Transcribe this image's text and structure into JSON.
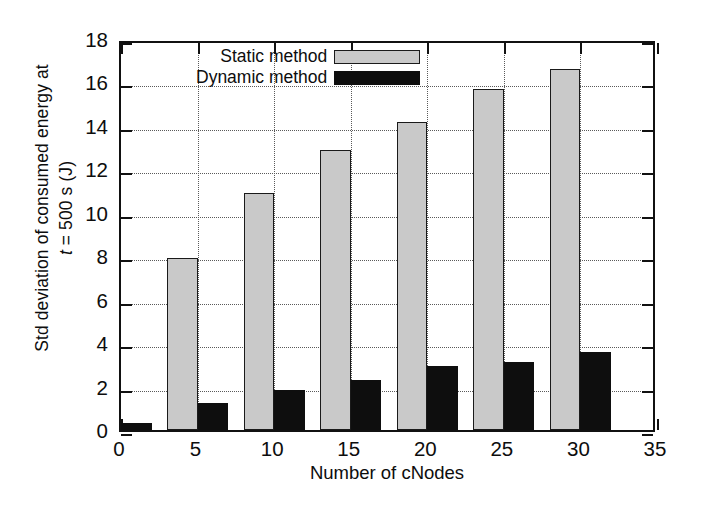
{
  "chart_data": {
    "type": "bar",
    "title": "",
    "xlabel": "Number of cNodes",
    "ylabel_line1": "Std deviation of consumed energy at",
    "ylabel_line2_prefix": "t",
    "ylabel_line2_rest": " = 500 s (J)",
    "categories": [
      0,
      5,
      10,
      15,
      20,
      25,
      30
    ],
    "xlim": [
      0,
      35
    ],
    "ylim": [
      0,
      18
    ],
    "xticks": [
      0,
      5,
      10,
      15,
      20,
      25,
      30,
      35
    ],
    "yticks": [
      0,
      2,
      4,
      6,
      8,
      10,
      12,
      14,
      16,
      18
    ],
    "grid": "dotted-both",
    "legend_position": "top-center",
    "series": [
      {
        "name": "Static method",
        "color": "#c9c9c9",
        "values": [
          null,
          7.9,
          10.9,
          12.9,
          14.2,
          15.7,
          16.6
        ]
      },
      {
        "name": "Dynamic method",
        "color": "#0e0e0e",
        "values": [
          0.3,
          1.25,
          1.85,
          2.3,
          2.95,
          3.15,
          3.6
        ]
      }
    ]
  },
  "legend": {
    "items": [
      {
        "label": "Static method",
        "swatch": "static"
      },
      {
        "label": "Dynamic method",
        "swatch": "dynamic"
      }
    ]
  },
  "axes": {
    "y_tick_labels": [
      "18",
      "16",
      "14",
      "12",
      "10",
      "8",
      "6",
      "4",
      "2",
      "0"
    ],
    "x_tick_labels": [
      "0",
      "5",
      "10",
      "15",
      "20",
      "25",
      "30",
      "35"
    ]
  },
  "colors": {
    "static_fill": "#c9c9c9",
    "dynamic_fill": "#0e0e0e",
    "axis": "#111111",
    "grid": "#5a5a5a",
    "background": "#ffffff"
  }
}
